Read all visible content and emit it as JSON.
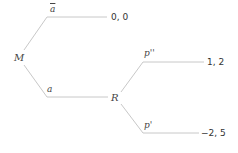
{
  "diagram": {
    "type": "game-tree",
    "colors": {
      "edge": "#c8c8c8",
      "text": "#444444"
    },
    "nodes": [
      {
        "id": "M",
        "label": "M"
      },
      {
        "id": "R",
        "label": "R"
      }
    ],
    "actions": {
      "a_bar": "a",
      "a": "a",
      "p_double_prime": "p''",
      "p_prime": "p'"
    },
    "payoffs": {
      "top": "0, 0",
      "mid": "1, 2",
      "bottom": "−2, 5"
    },
    "edges": [
      {
        "from": "M",
        "action": "ā",
        "to": "0, 0"
      },
      {
        "from": "M",
        "action": "a",
        "to": "R"
      },
      {
        "from": "R",
        "action": "p''",
        "to": "1, 2"
      },
      {
        "from": "R",
        "action": "p'",
        "to": "−2, 5"
      }
    ]
  }
}
